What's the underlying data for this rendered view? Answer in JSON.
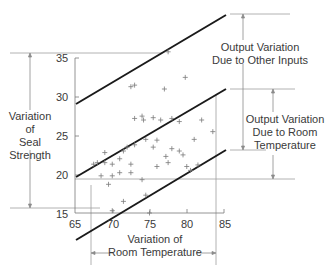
{
  "chart_data": {
    "type": "scatter",
    "title": "",
    "xlabel": "Variation of Room Temperature",
    "ylabel": "Variation of Seal Strength",
    "xlim": [
      65,
      85
    ],
    "ylim": [
      15,
      35
    ],
    "x_ticks": [
      "65",
      "70",
      "75",
      "80",
      "85"
    ],
    "y_ticks": [
      "35",
      "30",
      "25",
      "20",
      "15"
    ],
    "grid": false,
    "lines": [
      {
        "name": "upper band",
        "x": [
          65,
          85
        ],
        "y": [
          29,
          40.5
        ]
      },
      {
        "name": "regression",
        "x": [
          65,
          85
        ],
        "y": [
          19.5,
          31
        ]
      },
      {
        "name": "lower band",
        "x": [
          65,
          85
        ],
        "y": [
          8.5,
          23
        ]
      }
    ],
    "points": [
      [
        69.5,
        18.7
      ],
      [
        68.5,
        19.8
      ],
      [
        67.5,
        21.3
      ],
      [
        68,
        21.5
      ],
      [
        69,
        21.5
      ],
      [
        70,
        21.3
      ],
      [
        71,
        22.0
      ],
      [
        69,
        22.8
      ],
      [
        71.5,
        23.0
      ],
      [
        72,
        23.5
      ],
      [
        73,
        23.8
      ],
      [
        72.5,
        21.3
      ],
      [
        72.5,
        20.2
      ],
      [
        71,
        20.2
      ],
      [
        70,
        19.8
      ],
      [
        74,
        19.3
      ],
      [
        76,
        21.0
      ],
      [
        77.5,
        21.5
      ],
      [
        77.2,
        22.3
      ],
      [
        78,
        23.3
      ],
      [
        74.5,
        24.5
      ],
      [
        75.5,
        23.5
      ],
      [
        76,
        24.4
      ],
      [
        79,
        23.0
      ],
      [
        79.5,
        22.5
      ],
      [
        80,
        21.0
      ],
      [
        73,
        27.2
      ],
      [
        74,
        27.5
      ],
      [
        74.2,
        27.0
      ],
      [
        75.5,
        27.3
      ],
      [
        76.5,
        27.0
      ],
      [
        78,
        27.2
      ],
      [
        79,
        26.8
      ],
      [
        72.5,
        31.3
      ],
      [
        73,
        31.5
      ],
      [
        77,
        31.0
      ],
      [
        79.8,
        32.5
      ],
      [
        77.5,
        35.8
      ],
      [
        71.5,
        16.5
      ],
      [
        74.5,
        17.3
      ],
      [
        70,
        15.3
      ],
      [
        75,
        15.0
      ],
      [
        81,
        24.5
      ],
      [
        81.5,
        21.2
      ],
      [
        80.5,
        20.5
      ],
      [
        82,
        27.0
      ],
      [
        83.5,
        25.5
      ]
    ],
    "annotations": [
      "Variation of Seal Strength",
      "Output Variation Due to Other Inputs",
      "Output Variation Due to Room Temperature",
      "Variation of Room Temperature"
    ]
  },
  "labels": {
    "seal_strength": [
      "Variation",
      "of",
      "Seal",
      "Strength"
    ],
    "other_inputs": [
      "Output Variation",
      "Due to Other Inputs"
    ],
    "room_temp_output": [
      "Output Variation",
      "Due to Room",
      "Temperature"
    ],
    "room_temp_x": [
      "Variation of",
      "Room Temperature"
    ]
  },
  "axes": {
    "y_ticks": [
      "35",
      "30",
      "25",
      "20",
      "15"
    ],
    "x_ticks": [
      "65",
      "70",
      "75",
      "80",
      "85"
    ]
  },
  "colors": {
    "line": "#1a1a1a",
    "guide": "#9a9a9a",
    "text": "#3a3a3a",
    "marker": "#7a7a7a"
  }
}
